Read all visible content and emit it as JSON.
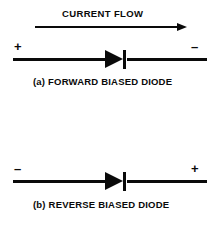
{
  "figure": {
    "width": 218,
    "height": 230,
    "background_color": "#ffffff",
    "ink_color": "#0a0a0a"
  },
  "flow": {
    "label": "CURRENT FLOW",
    "arrow_direction": "right",
    "arrow_icon": "arrow-right-icon"
  },
  "diagrams": [
    {
      "id": "forward",
      "caption": "(a) FORWARD BIASED DIODE",
      "left_terminal": "+",
      "right_terminal": "–",
      "component_icon": "diode-icon",
      "diode_orientation": "anode-left-cathode-right"
    },
    {
      "id": "reverse",
      "caption": "(b) REVERSE BIASED DIODE",
      "left_terminal": "–",
      "right_terminal": "+",
      "component_icon": "diode-icon",
      "diode_orientation": "anode-left-cathode-right"
    }
  ]
}
